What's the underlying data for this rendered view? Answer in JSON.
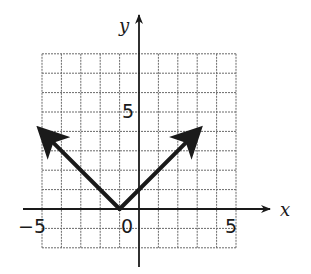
{
  "chart_data": {
    "type": "line",
    "title": "",
    "xlabel": "x",
    "ylabel": "y",
    "xlim": [
      -5,
      5
    ],
    "ylim": [
      -2,
      8
    ],
    "grid": true,
    "x_tick_labels": [
      "-5",
      "0",
      "5"
    ],
    "y_tick_labels": [
      "5"
    ],
    "function": "y = |x + 1|",
    "series": [
      {
        "name": "absolute value graph",
        "x": [
          -5,
          -1,
          3
        ],
        "y": [
          4,
          0,
          4
        ],
        "arrows_at_ends": true
      }
    ],
    "vertex": {
      "x": -1,
      "y": 0
    }
  },
  "labels": {
    "x_axis": "x",
    "y_axis": "y",
    "tick_neg5": "−5",
    "tick_0": "0",
    "tick_5x": "5",
    "tick_5y": "5"
  },
  "colors": {
    "grid": "#6a6a6a",
    "axis": "#1a1a1a",
    "curve": "#1a1a1a"
  }
}
